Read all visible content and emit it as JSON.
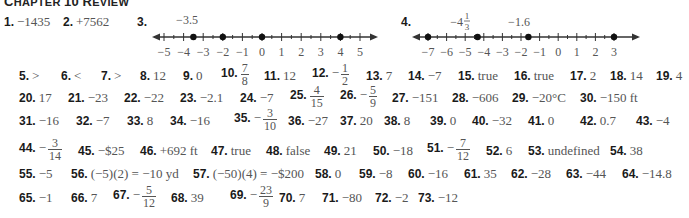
{
  "title": {
    "cap1": "C",
    "rest1": "HAPTER",
    "num": "10",
    "cap2": "R",
    "rest2": "EVIEW"
  },
  "answers": {
    "a1": {
      "n": "1.",
      "v": "−1435"
    },
    "a2": {
      "n": "2.",
      "v": "+7562"
    },
    "a3": {
      "n": "3."
    },
    "a4": {
      "n": "4."
    },
    "a5": {
      "n": "5.",
      "v": ">"
    },
    "a6": {
      "n": "6.",
      "v": "<"
    },
    "a7": {
      "n": "7.",
      "v": ">"
    },
    "a8": {
      "n": "8.",
      "v": "12"
    },
    "a9": {
      "n": "9.",
      "v": "0"
    },
    "a10": {
      "n": "10.",
      "num": "7",
      "den": "8"
    },
    "a11": {
      "n": "11.",
      "v": "12"
    },
    "a12": {
      "n": "12.",
      "sign": "−",
      "num": "1",
      "den": "2"
    },
    "a13": {
      "n": "13.",
      "v": "7"
    },
    "a14": {
      "n": "14.",
      "v": "−7"
    },
    "a15": {
      "n": "15.",
      "v": "true"
    },
    "a16": {
      "n": "16.",
      "v": "true"
    },
    "a17": {
      "n": "17.",
      "v": "2"
    },
    "a18": {
      "n": "18.",
      "v": "14"
    },
    "a19": {
      "n": "19.",
      "v": "4"
    },
    "a20": {
      "n": "20.",
      "v": "17"
    },
    "a21": {
      "n": "21.",
      "v": "−23"
    },
    "a22": {
      "n": "22.",
      "v": "−22"
    },
    "a23": {
      "n": "23.",
      "v": "−2.1"
    },
    "a24": {
      "n": "24.",
      "v": "−7"
    },
    "a25": {
      "n": "25.",
      "num": "4",
      "den": "15"
    },
    "a26": {
      "n": "26.",
      "sign": "−",
      "num": "5",
      "den": "9"
    },
    "a27": {
      "n": "27.",
      "v": "−151"
    },
    "a28": {
      "n": "28.",
      "v": "−606"
    },
    "a29": {
      "n": "29.",
      "v": "−20°C"
    },
    "a30": {
      "n": "30.",
      "v": "−150 ft"
    },
    "a31": {
      "n": "31.",
      "v": "−16"
    },
    "a32": {
      "n": "32.",
      "v": "−7"
    },
    "a33": {
      "n": "33.",
      "v": "8"
    },
    "a34": {
      "n": "34.",
      "v": "−16"
    },
    "a35": {
      "n": "35.",
      "sign": "−",
      "num": "3",
      "den": "10"
    },
    "a36": {
      "n": "36.",
      "v": "−27"
    },
    "a37": {
      "n": "37.",
      "v": "20"
    },
    "a38": {
      "n": "38.",
      "v": "8"
    },
    "a39": {
      "n": "39.",
      "v": "0"
    },
    "a40": {
      "n": "40.",
      "v": "−32"
    },
    "a41": {
      "n": "41.",
      "v": "0"
    },
    "a42": {
      "n": "42.",
      "v": "0.7"
    },
    "a43": {
      "n": "43.",
      "v": "−4"
    },
    "a44": {
      "n": "44.",
      "sign": "−",
      "num": "3",
      "den": "14"
    },
    "a45": {
      "n": "45.",
      "v": "−$25"
    },
    "a46": {
      "n": "46.",
      "v": "+692 ft"
    },
    "a47": {
      "n": "47.",
      "v": "true"
    },
    "a48": {
      "n": "48.",
      "v": "false"
    },
    "a49": {
      "n": "49.",
      "v": "21"
    },
    "a50": {
      "n": "50.",
      "v": "−18"
    },
    "a51": {
      "n": "51.",
      "sign": "−",
      "num": "7",
      "den": "12"
    },
    "a52": {
      "n": "52.",
      "v": "6"
    },
    "a53": {
      "n": "53.",
      "v": "undefined"
    },
    "a54": {
      "n": "54.",
      "v": "38"
    },
    "a55": {
      "n": "55.",
      "v": "−5"
    },
    "a56": {
      "n": "56.",
      "v": "(−5)(2) = −10 yd"
    },
    "a57": {
      "n": "57.",
      "v": "(−50)(4) = −$200"
    },
    "a58": {
      "n": "58.",
      "v": "0"
    },
    "a59": {
      "n": "59.",
      "v": "−8"
    },
    "a60": {
      "n": "60.",
      "v": "−16"
    },
    "a61": {
      "n": "61.",
      "v": "35"
    },
    "a62": {
      "n": "62.",
      "v": "−28"
    },
    "a63": {
      "n": "63.",
      "v": "−44"
    },
    "a64": {
      "n": "64.",
      "v": "−14.8"
    },
    "a65": {
      "n": "65.",
      "v": "−1"
    },
    "a66": {
      "n": "66.",
      "v": "7"
    },
    "a67": {
      "n": "67.",
      "sign": "−",
      "num": "5",
      "den": "12"
    },
    "a68": {
      "n": "68.",
      "v": "39"
    },
    "a69": {
      "n": "69.",
      "sign": "−",
      "num": "23",
      "den": "9"
    },
    "a70": {
      "n": "70.",
      "v": "7"
    },
    "a71": {
      "n": "71.",
      "v": "−80"
    },
    "a72": {
      "n": "72.",
      "v": "−2"
    },
    "a73": {
      "n": "73.",
      "v": "−12"
    }
  },
  "numberline3": {
    "ticks": [
      "−5",
      "−4",
      "−3",
      "−2",
      "−1",
      "0",
      "1",
      "2",
      "3",
      "4",
      "5"
    ],
    "points": [
      -3.5,
      -2,
      0,
      4
    ],
    "label_point": "−3.5"
  },
  "numberline4": {
    "ticks": [
      "−7",
      "−6",
      "−5",
      "−4",
      "−3",
      "−2",
      "−1",
      "0",
      "1",
      "2",
      "3"
    ],
    "points": [
      -7,
      -4.3333,
      -1.6,
      3
    ],
    "label_a_whole": "−4",
    "label_a_num": "1",
    "label_a_den": "3",
    "label_b": "−1.6"
  }
}
